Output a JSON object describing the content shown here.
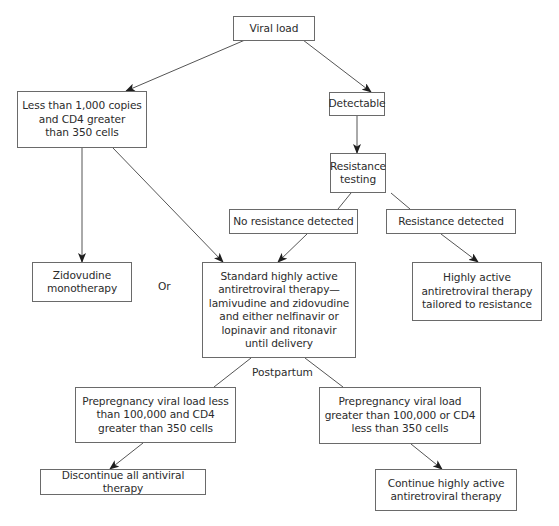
{
  "diagram": {
    "type": "flowchart",
    "nodes": [
      {
        "id": "viral-load",
        "text": "Viral load"
      },
      {
        "id": "low-viral-load",
        "text": "Less than 1,000 copies\nand CD4 greater\nthan 350 cells"
      },
      {
        "id": "detectable",
        "text": "Detectable"
      },
      {
        "id": "resistance-testing",
        "text": "Resistance\ntesting"
      },
      {
        "id": "no-resistance",
        "text": "No resistance detected"
      },
      {
        "id": "resistance",
        "text": "Resistance detected"
      },
      {
        "id": "zidovudine",
        "text": "Zidovudine\nmonotherapy"
      },
      {
        "id": "standard-haart",
        "text": "Standard highly active\nantiretroviral therapy—\nlamivudine and zidovudine\nand either nelfinavir or\nlopinavir and ritonavir\nuntil delivery"
      },
      {
        "id": "tailored-haart",
        "text": "Highly active\nantiretroviral therapy\ntailored to resistance"
      },
      {
        "id": "prepreg-low",
        "text": "Prepregnancy viral load less\nthan 100,000 and CD4\ngreater than 350 cells"
      },
      {
        "id": "prepreg-high",
        "text": "Prepregnancy viral load\ngreater than 100,000 or CD4\nless than 350 cells"
      },
      {
        "id": "discontinue",
        "text": "Discontinue all antiviral therapy"
      },
      {
        "id": "continue",
        "text": "Continue highly active\nantiretroviral therapy"
      }
    ],
    "labels": {
      "or": "Or",
      "postpartum": "Postpartum"
    },
    "edges": [
      {
        "from": "viral-load",
        "to": "low-viral-load",
        "arrow": true
      },
      {
        "from": "viral-load",
        "to": "detectable",
        "arrow": true
      },
      {
        "from": "detectable",
        "to": "resistance-testing",
        "arrow": true
      },
      {
        "from": "resistance-testing",
        "to": "no-resistance",
        "arrow": false
      },
      {
        "from": "resistance-testing",
        "to": "resistance",
        "arrow": false
      },
      {
        "from": "low-viral-load",
        "to": "zidovudine",
        "arrow": true
      },
      {
        "from": "low-viral-load",
        "to": "standard-haart",
        "arrow": true
      },
      {
        "from": "no-resistance",
        "to": "standard-haart",
        "arrow": true
      },
      {
        "from": "resistance",
        "to": "tailored-haart",
        "arrow": true
      },
      {
        "from": "standard-haart",
        "to": "prepreg-low",
        "arrow": false
      },
      {
        "from": "standard-haart",
        "to": "prepreg-high",
        "arrow": false
      },
      {
        "from": "prepreg-low",
        "to": "discontinue",
        "arrow": true
      },
      {
        "from": "prepreg-high",
        "to": "continue",
        "arrow": true
      }
    ],
    "colors": {
      "line": "#555555",
      "box_border": "#6a6a6a",
      "text": "#2b2b2b"
    }
  }
}
